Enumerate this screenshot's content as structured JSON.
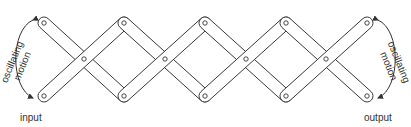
{
  "diagram": {
    "type": "lazy-tongs linkage (scissor mechanism)",
    "labels": {
      "input": "input",
      "output": "output",
      "left_motion_line1": "oscillating",
      "left_motion_line2": "motion",
      "right_motion_line1": "oscillating",
      "right_motion_line2": "motion"
    },
    "joints": {
      "top": [
        [
          44,
          23
        ],
        [
          124,
          23
        ],
        [
          205,
          23
        ],
        [
          286,
          23
        ],
        [
          367,
          23
        ]
      ],
      "bottom": [
        [
          44,
          96
        ],
        [
          124,
          96
        ],
        [
          205,
          96
        ],
        [
          286,
          96
        ],
        [
          367,
          96
        ]
      ],
      "center": [
        [
          84,
          59
        ],
        [
          165,
          59
        ],
        [
          246,
          59
        ],
        [
          326,
          59
        ]
      ]
    },
    "links": [
      {
        "from": [
          44,
          23
        ],
        "to": [
          124,
          96
        ]
      },
      {
        "from": [
          44,
          96
        ],
        "to": [
          124,
          23
        ]
      },
      {
        "from": [
          124,
          23
        ],
        "to": [
          205,
          96
        ]
      },
      {
        "from": [
          124,
          96
        ],
        "to": [
          205,
          23
        ]
      },
      {
        "from": [
          205,
          23
        ],
        "to": [
          286,
          96
        ]
      },
      {
        "from": [
          205,
          96
        ],
        "to": [
          286,
          23
        ]
      },
      {
        "from": [
          286,
          23
        ],
        "to": [
          367,
          96
        ]
      },
      {
        "from": [
          286,
          96
        ],
        "to": [
          367,
          23
        ]
      }
    ],
    "colors": {
      "stroke": "#333333",
      "fill": "#ffffff"
    }
  }
}
